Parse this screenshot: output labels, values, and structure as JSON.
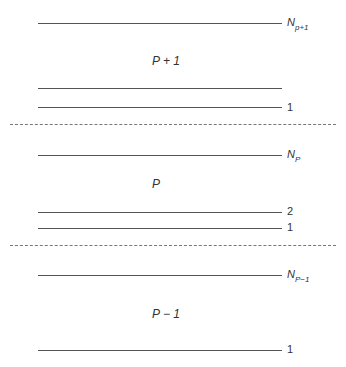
{
  "diagram": {
    "groups": [
      {
        "name": "P + 1",
        "lines": [
          {
            "label_main": "N",
            "label_sub": "p+1",
            "y": 23
          },
          {
            "label_main": "",
            "label_sub": "",
            "y": 88
          },
          {
            "label_main": "1",
            "label_sub": "",
            "y": 107
          }
        ]
      },
      {
        "name": "P",
        "lines": [
          {
            "label_main": "N",
            "label_sub": "P",
            "y": 155
          },
          {
            "label_main": "2",
            "label_sub": "",
            "y": 212
          },
          {
            "label_main": "1",
            "label_sub": "",
            "y": 228
          }
        ]
      },
      {
        "name": "P − 1",
        "lines": [
          {
            "label_main": "N",
            "label_sub": "P−1",
            "y": 275
          },
          {
            "label_main": "1",
            "label_sub": "",
            "y": 350
          }
        ]
      }
    ],
    "separators": [
      124,
      245
    ]
  }
}
